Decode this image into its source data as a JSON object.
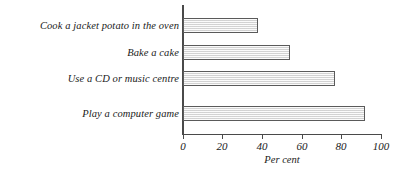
{
  "chart_data": {
    "type": "bar",
    "orientation": "horizontal",
    "title": "",
    "xlabel": "Per cent",
    "ylabel": "",
    "categories": [
      "Cook a jacket potato in the oven",
      "Bake a cake",
      "Use a CD or music centre",
      "Play a computer game"
    ],
    "values": [
      38,
      54,
      77,
      92
    ],
    "xlim": [
      0,
      100
    ],
    "xticks": [
      0,
      20,
      40,
      60,
      80,
      100
    ],
    "xtick_labels": [
      "0",
      "20",
      "40",
      "60",
      "80",
      "100"
    ],
    "grid": false,
    "legend": null,
    "bar_fill_color": "#e4e4e4",
    "bar_border_color": "#5a5a5a",
    "axis_color": "#4a4a4a",
    "background_color": "#ffffff"
  }
}
